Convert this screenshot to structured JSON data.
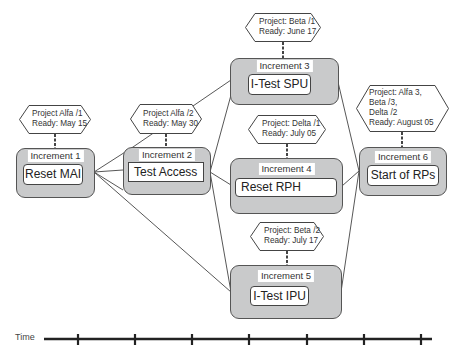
{
  "diagram": {
    "increments": [
      {
        "id": "inc1",
        "title": "Increment 1",
        "task": "Reset MAI",
        "milestone": [
          "Project Alfa /1",
          "Ready: May 15"
        ]
      },
      {
        "id": "inc2",
        "title": "Increment 2",
        "task": "Test Access",
        "milestone": [
          "Project Alfa /2",
          "Ready: May 30"
        ]
      },
      {
        "id": "inc3",
        "title": "Increment 3",
        "task": "I-Test SPU",
        "milestone": [
          "Project: Beta /1",
          "Ready: June 17"
        ]
      },
      {
        "id": "inc4",
        "title": "Increment 4",
        "task": "Reset RPH",
        "milestone": [
          "Project: Delta /1",
          "Ready: July 05"
        ]
      },
      {
        "id": "inc5",
        "title": "Increment 5",
        "task": "I-Test IPU",
        "milestone": [
          "Project: Beta /2",
          "Ready: July 17"
        ]
      },
      {
        "id": "inc6",
        "title": "Increment 6",
        "task": "Start of RPs",
        "milestone": [
          "Project: Alfa 3,",
          "Beta /3,",
          "Delta /2",
          "Ready: August 05"
        ]
      }
    ],
    "connections": [
      [
        "inc1",
        "inc2"
      ],
      [
        "inc1",
        "inc3"
      ],
      [
        "inc1",
        "inc4"
      ],
      [
        "inc1",
        "inc5"
      ],
      [
        "inc2",
        "inc3"
      ],
      [
        "inc2",
        "inc4"
      ],
      [
        "inc2",
        "inc5"
      ],
      [
        "inc3",
        "inc6"
      ],
      [
        "inc4",
        "inc6"
      ],
      [
        "inc5",
        "inc6"
      ]
    ],
    "timeline": {
      "label": "Time",
      "ticks": 7
    }
  }
}
